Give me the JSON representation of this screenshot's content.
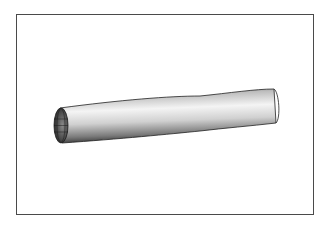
{
  "figure": {
    "colors": {
      "frame": "#4a4a4a",
      "mesh_lines": "#1a1a1a",
      "shade_light": "#f0f0f0",
      "shade_dark": "#4a4a4a"
    },
    "mesh": {
      "axial_divisions": 40,
      "circumferential_divisions": 12
    }
  }
}
